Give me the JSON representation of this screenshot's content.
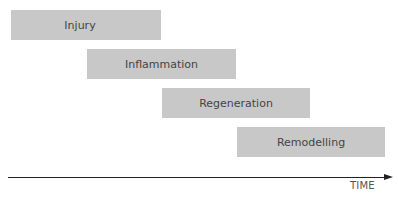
{
  "diagram": {
    "type": "timeline-phases",
    "phases": [
      {
        "label": "Injury",
        "order": 1
      },
      {
        "label": "Inflammation",
        "order": 2
      },
      {
        "label": "Regeneration",
        "order": 3
      },
      {
        "label": "Remodelling",
        "order": 4
      }
    ],
    "axis": {
      "label": "TIME",
      "direction": "right"
    },
    "colors": {
      "box": "#c8c8c8",
      "text": "#444444",
      "axis": "#222222"
    }
  }
}
